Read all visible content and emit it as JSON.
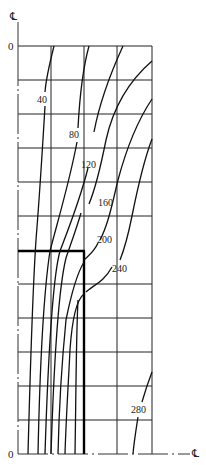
{
  "diagram": {
    "type": "contour-plot",
    "axis_symbol_top": "℄",
    "axis_symbol_right": "℄",
    "origin_top_label": "0",
    "origin_bottom_label": "0",
    "grid": {
      "columns": 4,
      "rows": 12
    },
    "contour_labels": [
      "40",
      "80",
      "120",
      "160",
      "200",
      "240",
      "280"
    ],
    "line_color": "#111111",
    "grid_color": "#222222"
  }
}
